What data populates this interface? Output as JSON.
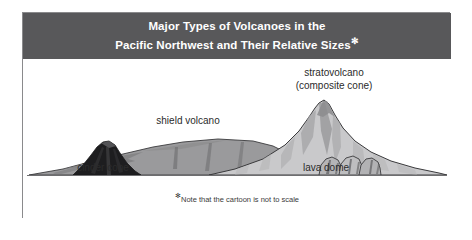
{
  "figure": {
    "header": {
      "title_line_1": "Major Types of Volcanoes in the",
      "title_line_2": "Pacific Northwest and Their Relative Sizes",
      "title_footnote_marker": "✻",
      "background_color": "#58585a",
      "text_color": "#ffffff"
    },
    "diagram": {
      "background_color": "#ffffff",
      "ground_line_color": "#6e6e70",
      "labels": [
        {
          "id": "stratovolcano",
          "line_1": "stratovolcano",
          "line_2": "(composite cone)"
        },
        {
          "id": "shield-volcano",
          "line_1": "shield volcano"
        },
        {
          "id": "cinder-cone",
          "line_1": "cinder cone"
        },
        {
          "id": "lava-dome",
          "line_1": "lava dome"
        }
      ],
      "shapes": {
        "cinder_cone_fill": "#1d1d1f",
        "shield_volcano_fill": "#9a9a9c",
        "stratovolcano_fill": "#c9c9cb",
        "stratovolcano_shade": "#8e8e90",
        "lava_dome_fill": "#b5b5b7",
        "outline_color": "#3a3a3c"
      }
    },
    "footnote": {
      "marker": "✻",
      "text": "Note that the cartoon is not to scale"
    },
    "border_color": "#8a8a8c"
  }
}
